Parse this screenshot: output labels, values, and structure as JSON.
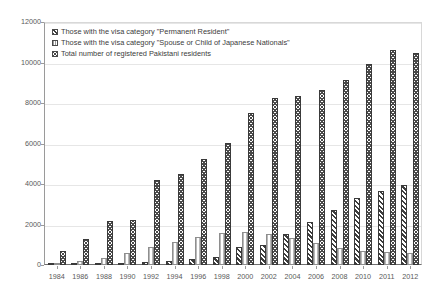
{
  "chart_data": {
    "type": "bar",
    "title": "",
    "xlabel": "",
    "ylabel": "",
    "ylim": [
      0,
      12000
    ],
    "grid": true,
    "legend_position": "top-left",
    "categories": [
      "1984",
      "1986",
      "1988",
      "1990",
      "1992",
      "1994",
      "1996",
      "1998",
      "2000",
      "2002",
      "2004",
      "2006",
      "2008",
      "2010",
      "2011",
      "2012"
    ],
    "yticks": [
      "0",
      "2000",
      "4000",
      "6000",
      "8000",
      "10000",
      "12000"
    ],
    "ytick_values": [
      0,
      2000,
      4000,
      6000,
      8000,
      10000,
      12000
    ],
    "series": [
      {
        "name": "Those with the visa category \"Permanent Resident\"",
        "pattern": "diagonal-hatch-dark",
        "values": [
          30,
          40,
          60,
          90,
          150,
          200,
          280,
          420,
          900,
          1000,
          1550,
          2100,
          2700,
          3300,
          3650,
          3950
        ]
      },
      {
        "name": "Those with the visa category \"Spouse or Child of Japanese Nationals\"",
        "pattern": "vertical-hatch-light",
        "values": [
          60,
          190,
          330,
          600,
          900,
          1150,
          1400,
          1600,
          1650,
          1550,
          1350,
          1100,
          850,
          700,
          640,
          600
        ]
      },
      {
        "name": "Total number of registered Pakistani residents",
        "pattern": "checker-dark",
        "values": [
          700,
          1300,
          2150,
          2200,
          4200,
          4500,
          5250,
          6050,
          7500,
          8250,
          8350,
          8650,
          9150,
          9950,
          10600,
          10450
        ]
      }
    ]
  },
  "legend": {
    "items": [
      {
        "label": "Those with the visa category \"Permanent Resident\""
      },
      {
        "label": "Those with the visa category \"Spouse or Child of Japanese Nationals\""
      },
      {
        "label": "Total number of registered Pakistani residents"
      }
    ]
  }
}
